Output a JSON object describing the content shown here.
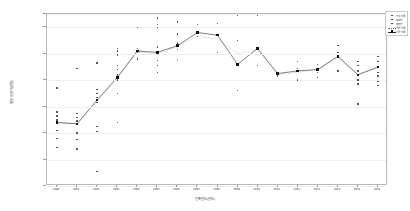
{
  "chart_data": {
    "type": "scatter",
    "title": "",
    "xlabel": "건축년도(년도)",
    "ylabel": "평당 분양가(만원)",
    "xlim": [
      0,
      17
    ],
    "ylim": [
      30000,
      160000
    ],
    "grid": true,
    "legend_position": "top-right",
    "yticks": [
      "30000",
      "50000",
      "70000",
      "90000",
      "110000",
      "130000",
      "150000",
      "160000"
    ],
    "ytick_values": [
      30000,
      50000,
      70000,
      90000,
      110000,
      130000,
      150000,
      160000
    ],
    "categories": [
      "2000",
      "2001",
      "2002",
      "2003",
      "2004",
      "2005",
      "2006",
      "2007",
      "2008",
      "2009",
      "2010",
      "2011",
      "2012",
      "2013",
      "2014",
      "2015",
      "2016"
    ],
    "series": [
      {
        "name": "평당 가격",
        "type": "line_marker",
        "values": [
          78000,
          77000,
          95000,
          112000,
          132000,
          131000,
          136000,
          146000,
          144000,
          122000,
          134000,
          115000,
          117000,
          118000,
          128000,
          114000,
          120000
        ]
      },
      {
        "name": "공급 가격",
        "type": "line_dotted",
        "values": [
          78000,
          77000,
          94000,
          111000,
          131000,
          130000,
          135000,
          143000,
          141000,
          130000,
          133000,
          114000,
          116000,
          118000,
          127000,
          115000,
          119000
        ]
      }
    ],
    "scatter_points": [
      {
        "x": 0,
        "y": 104000
      },
      {
        "x": 0,
        "y": 86000
      },
      {
        "x": 0,
        "y": 83000
      },
      {
        "x": 0,
        "y": 80000
      },
      {
        "x": 0,
        "y": 78000
      },
      {
        "x": 0,
        "y": 72000
      },
      {
        "x": 0,
        "y": 66000
      },
      {
        "x": 0,
        "y": 59000
      },
      {
        "x": 1,
        "y": 119000
      },
      {
        "x": 1,
        "y": 85000
      },
      {
        "x": 1,
        "y": 82000
      },
      {
        "x": 1,
        "y": 79000
      },
      {
        "x": 1,
        "y": 77000
      },
      {
        "x": 1,
        "y": 70000
      },
      {
        "x": 1,
        "y": 65000
      },
      {
        "x": 1,
        "y": 58000
      },
      {
        "x": 2,
        "y": 123000
      },
      {
        "x": 2,
        "y": 103000
      },
      {
        "x": 2,
        "y": 100000
      },
      {
        "x": 2,
        "y": 97000
      },
      {
        "x": 2,
        "y": 95000
      },
      {
        "x": 2,
        "y": 93000
      },
      {
        "x": 2,
        "y": 75000
      },
      {
        "x": 2,
        "y": 71000
      },
      {
        "x": 2,
        "y": 41000
      },
      {
        "x": 3,
        "y": 134000
      },
      {
        "x": 3,
        "y": 132000
      },
      {
        "x": 3,
        "y": 129000
      },
      {
        "x": 3,
        "y": 121000
      },
      {
        "x": 3,
        "y": 118000
      },
      {
        "x": 3,
        "y": 114000
      },
      {
        "x": 3,
        "y": 110000
      },
      {
        "x": 3,
        "y": 100000
      },
      {
        "x": 3,
        "y": 78000
      },
      {
        "x": 4,
        "y": 150000
      },
      {
        "x": 4,
        "y": 134000
      },
      {
        "x": 4,
        "y": 131000
      },
      {
        "x": 4,
        "y": 126000
      },
      {
        "x": 5,
        "y": 157000
      },
      {
        "x": 5,
        "y": 152000
      },
      {
        "x": 5,
        "y": 150000
      },
      {
        "x": 5,
        "y": 135000
      },
      {
        "x": 5,
        "y": 131000
      },
      {
        "x": 5,
        "y": 125000
      },
      {
        "x": 5,
        "y": 121000
      },
      {
        "x": 5,
        "y": 116000
      },
      {
        "x": 6,
        "y": 154000
      },
      {
        "x": 6,
        "y": 145000
      },
      {
        "x": 6,
        "y": 138000
      },
      {
        "x": 6,
        "y": 133000
      },
      {
        "x": 6,
        "y": 125000
      },
      {
        "x": 7,
        "y": 152000
      },
      {
        "x": 7,
        "y": 143000
      },
      {
        "x": 8,
        "y": 153000
      },
      {
        "x": 8,
        "y": 131000
      },
      {
        "x": 9,
        "y": 159000
      },
      {
        "x": 9,
        "y": 140000
      },
      {
        "x": 9,
        "y": 122000
      },
      {
        "x": 9,
        "y": 102000
      },
      {
        "x": 10,
        "y": 159000
      },
      {
        "x": 10,
        "y": 121000
      },
      {
        "x": 11,
        "y": 113000
      },
      {
        "x": 12,
        "y": 124000
      },
      {
        "x": 12,
        "y": 119000
      },
      {
        "x": 12,
        "y": 110000
      },
      {
        "x": 13,
        "y": 122000
      },
      {
        "x": 13,
        "y": 119000
      },
      {
        "x": 13,
        "y": 116000
      },
      {
        "x": 13,
        "y": 112000
      },
      {
        "x": 14,
        "y": 136000
      },
      {
        "x": 14,
        "y": 131000
      },
      {
        "x": 14,
        "y": 117000
      },
      {
        "x": 15,
        "y": 124000
      },
      {
        "x": 15,
        "y": 121000
      },
      {
        "x": 15,
        "y": 117000
      },
      {
        "x": 15,
        "y": 110000
      },
      {
        "x": 15,
        "y": 107000
      },
      {
        "x": 15,
        "y": 92000
      },
      {
        "x": 16,
        "y": 128000
      },
      {
        "x": 16,
        "y": 124000
      },
      {
        "x": 16,
        "y": 120000
      },
      {
        "x": 16,
        "y": 116000
      },
      {
        "x": 16,
        "y": 113000
      },
      {
        "x": 16,
        "y": 109000
      },
      {
        "x": 16,
        "y": 106000
      }
    ]
  },
  "legend": {
    "entries": [
      {
        "label": "평당 가격",
        "marker": "dot"
      },
      {
        "label": "최고가",
        "marker": "dot"
      },
      {
        "label": "최저가",
        "marker": "dot"
      },
      {
        "label": "공급 가격",
        "marker": "dotted-line"
      },
      {
        "label": "평균 가격",
        "marker": "line-square"
      }
    ]
  },
  "colors": {
    "point": "#3a3a3a",
    "mean_line": "#2a2a2a",
    "supply_line": "#9a9a9a",
    "grid": "#f0f0f0",
    "frame": "#b9b9b9",
    "background": "#ffffff"
  }
}
